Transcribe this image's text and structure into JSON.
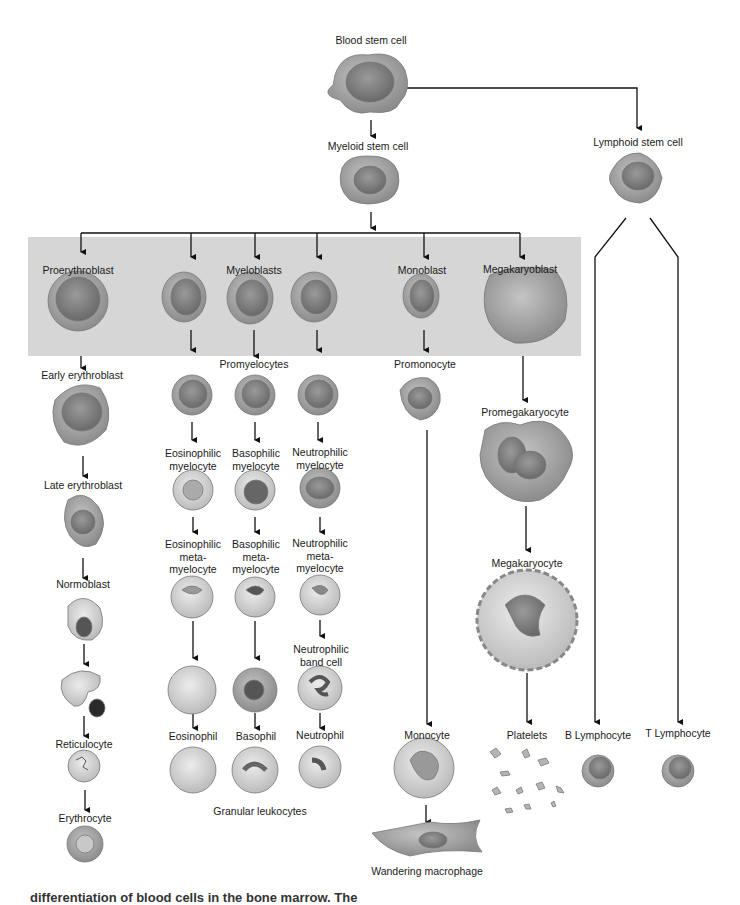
{
  "diagram": {
    "title": "Differentiation of blood cells in the bone marrow",
    "caption_cutoff": "differentiation of blood cells in the bone marrow. The",
    "colors": {
      "band": "#d6d6d6",
      "cell_fill": "#a9a9a9",
      "nucleus": "#7d7d7d",
      "line": "#111111"
    },
    "labels": {
      "blood_stem_cell": "Blood stem cell",
      "myeloid_stem_cell": "Myeloid stem cell",
      "lymphoid_stem_cell": "Lymphoid stem cell",
      "proerythroblast": "Proerythroblast",
      "myeloblasts": "Myeloblasts",
      "monoblast": "Monoblast",
      "megakaryoblast": "Megakaryoblast",
      "early_erythroblast": "Early erythroblast",
      "promyelocytes": "Promyelocytes",
      "promonocyte": "Promonocyte",
      "promegakaryocyte": "Promegakaryocyte",
      "late_erythroblast": "Late erythroblast",
      "eosinophilic_myelocyte": "Eosinophilic\nmyelocyte",
      "basophilic_myelocyte": "Basophilic\nmyelocyte",
      "neutrophilic_myelocyte": "Neutrophilic\nmyelocyte",
      "normoblast": "Normoblast",
      "eosinophilic_metamyelocyte": "Eosinophilic\nmeta-\nmyelocyte",
      "basophilic_metamyelocyte": "Basophilic\nmeta-\nmyelocyte",
      "neutrophilic_metamyelocyte": "Neutrophilic\nmeta-\nmyelocyte",
      "megakaryocyte": "Megakaryocyte",
      "neutrophilic_band_cell": "Neutrophilic\nband cell",
      "reticulocyte": "Reticulocyte",
      "eosinophil": "Eosinophil",
      "basophil": "Basophil",
      "neutrophil": "Neutrophil",
      "monocyte": "Monocyte",
      "platelets": "Platelets",
      "b_lymphocyte": "B Lymphocyte",
      "t_lymphocyte": "T Lymphocyte",
      "erythrocyte": "Erythrocyte",
      "granular_leukocytes": "Granular leukocytes",
      "wandering_macrophage": "Wandering macrophage"
    }
  }
}
